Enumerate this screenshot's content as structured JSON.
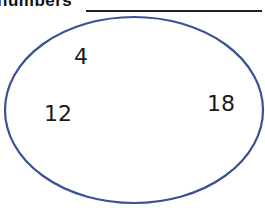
{
  "header": {
    "title": "numbers",
    "answer_blank": ""
  },
  "diagram": {
    "shape": "ellipse",
    "stroke_color": "#3a5196",
    "numbers": [
      {
        "value": "4",
        "x": 74,
        "y": 46
      },
      {
        "value": "12",
        "x": 44,
        "y": 103
      },
      {
        "value": "18",
        "x": 207,
        "y": 93
      }
    ]
  }
}
